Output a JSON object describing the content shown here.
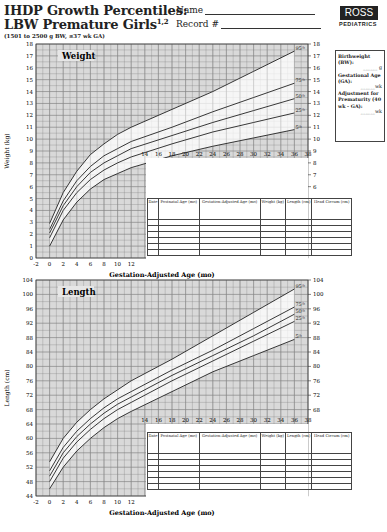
{
  "header": {
    "title_line1": "IHDP Growth Percentiles:",
    "title_line2": "LBW Premature Girls",
    "title_sup": "1,2",
    "subtitle": "(1501 to 2500 g BW, ≤37 wk GA)",
    "name_label": "Name",
    "record_label": "Record #",
    "logo_text": "ROSS",
    "logo_sub": "PEDIATRICS"
  },
  "sidebox": {
    "bw_label": "Birthweight (BW):",
    "bw_unit": "g",
    "ga_label": "Gestational Age (GA):",
    "ga_unit": "wk",
    "adj_label": "Adjustment for Prematurity (40 wk - GA):",
    "adj_unit": "wk"
  },
  "record_table": {
    "headers": [
      "Date",
      "Postnatal Age (mo)",
      "Gestation-Adjusted Age (mo)",
      "Weight (kg)",
      "Length (cm)",
      "Head Circum (cm)"
    ],
    "row_count": 6
  },
  "chart_data": [
    {
      "type": "line",
      "title": "Weight",
      "xlabel": "Gestation-Adjusted Age (mo)",
      "ylabel": "Weight (kg)",
      "x_ticks": [
        -2,
        0,
        2,
        4,
        6,
        8,
        10,
        12,
        14,
        16,
        18,
        20,
        22,
        24,
        26,
        28,
        30,
        32,
        34,
        36,
        38
      ],
      "y_ticks": [
        0,
        1,
        2,
        3,
        4,
        5,
        6,
        7,
        8,
        9,
        10,
        11,
        12,
        13,
        14,
        15,
        16,
        17,
        18
      ],
      "xlim": [
        -2,
        38
      ],
      "ylim": [
        0,
        18
      ],
      "grid": true,
      "x": [
        0,
        2,
        4,
        6,
        8,
        10,
        12,
        18,
        24,
        30,
        36
      ],
      "series": [
        {
          "name": "95th",
          "values": [
            2.9,
            5.5,
            7.3,
            8.7,
            9.6,
            10.4,
            11.0,
            12.5,
            14.0,
            15.7,
            17.4
          ]
        },
        {
          "name": "75th",
          "values": [
            2.4,
            4.8,
            6.5,
            7.7,
            8.6,
            9.2,
            9.8,
            11.0,
            12.3,
            13.5,
            14.7
          ]
        },
        {
          "name": "50th",
          "values": [
            2.1,
            4.4,
            6.0,
            7.2,
            8.0,
            8.6,
            9.2,
            10.3,
            11.4,
            12.4,
            13.4
          ]
        },
        {
          "name": "25th",
          "values": [
            1.7,
            4.0,
            5.5,
            6.6,
            7.4,
            8.0,
            8.5,
            9.6,
            10.6,
            11.4,
            12.2
          ]
        },
        {
          "name": "5th",
          "values": [
            1.0,
            3.2,
            4.7,
            5.8,
            6.6,
            7.1,
            7.6,
            8.6,
            9.4,
            10.1,
            10.8
          ]
        }
      ]
    },
    {
      "type": "line",
      "title": "Length",
      "xlabel": "Gestation-Adjusted Age (mo)",
      "ylabel": "Length (cm)",
      "x_ticks": [
        -2,
        0,
        2,
        4,
        6,
        8,
        10,
        12,
        14,
        16,
        18,
        20,
        22,
        24,
        26,
        28,
        30,
        32,
        34,
        36,
        38
      ],
      "y_ticks": [
        44,
        48,
        52,
        56,
        60,
        64,
        68,
        72,
        76,
        80,
        84,
        88,
        92,
        96,
        100,
        104
      ],
      "xlim": [
        -2,
        38
      ],
      "ylim": [
        44,
        104
      ],
      "grid": true,
      "x": [
        0,
        2,
        4,
        6,
        8,
        10,
        12,
        18,
        24,
        30,
        36
      ],
      "series": [
        {
          "name": "95th",
          "values": [
            53.5,
            60.0,
            64.5,
            68.0,
            71.0,
            73.5,
            76.0,
            82.0,
            88.5,
            95.0,
            101.5
          ]
        },
        {
          "name": "75th",
          "values": [
            51.0,
            57.5,
            62.0,
            65.5,
            68.5,
            71.0,
            73.0,
            79.0,
            84.5,
            90.5,
            96.5
          ]
        },
        {
          "name": "50th",
          "values": [
            49.5,
            56.0,
            60.5,
            64.0,
            67.0,
            69.5,
            71.5,
            77.5,
            83.0,
            88.5,
            94.5
          ]
        },
        {
          "name": "25th",
          "values": [
            48.0,
            54.5,
            59.0,
            62.5,
            65.5,
            68.0,
            70.0,
            76.0,
            81.5,
            87.0,
            92.5
          ]
        },
        {
          "name": "5th",
          "values": [
            46.0,
            52.0,
            56.5,
            60.0,
            63.0,
            65.5,
            67.5,
            73.0,
            78.5,
            83.0,
            87.5
          ]
        }
      ]
    }
  ]
}
